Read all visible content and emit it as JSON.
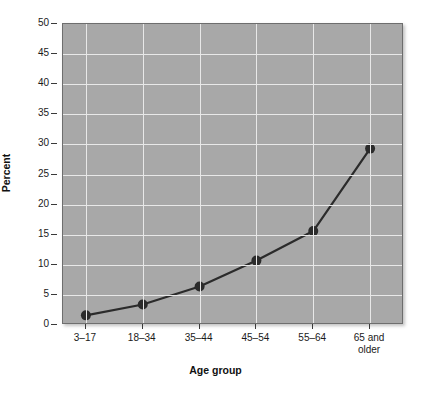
{
  "chart_data": {
    "type": "line",
    "title": "",
    "xlabel": "Age group",
    "ylabel": "Percent",
    "categories": [
      "3–17",
      "18–34",
      "35–44",
      "45–54",
      "55–64",
      "65 and\nolder"
    ],
    "category_lines": [
      [
        "3–17"
      ],
      [
        "18–34"
      ],
      [
        "35–44"
      ],
      [
        "45–54"
      ],
      [
        "55–64"
      ],
      [
        "65 and",
        "older"
      ]
    ],
    "values": [
      1.6,
      3.4,
      6.4,
      10.7,
      15.6,
      29.3
    ],
    "series": [
      {
        "name": "Percent",
        "values": [
          1.6,
          3.4,
          6.4,
          10.7,
          15.6,
          29.3
        ]
      }
    ],
    "ylim": [
      0,
      50
    ],
    "y_ticks": [
      0,
      5,
      10,
      15,
      20,
      25,
      30,
      35,
      40,
      45,
      50
    ],
    "y_tick_labels": [
      "0",
      "5",
      "10",
      "15",
      "20",
      "25",
      "30",
      "35",
      "40",
      "45",
      "50"
    ],
    "grid": "horizontal-and-vertical",
    "legend": "none",
    "colors": {
      "plot_background": "#a8a8a8",
      "gridline": "#e8e8e8",
      "line": "#2b2b2b",
      "marker": "#2b2b2b",
      "axis_text": "#1a1a1a",
      "plot_border": "#6e6e6e"
    }
  }
}
